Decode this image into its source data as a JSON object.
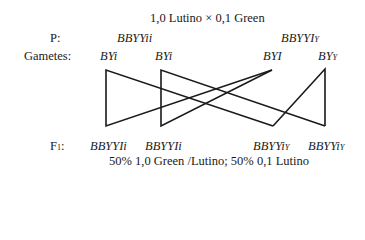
{
  "title": "1,0 Lutino × 0,1 Green",
  "labels": {
    "parents": "P:",
    "gametes": "Gametes:",
    "f1": "F",
    "f1_sub": "1",
    "f1_colon": ":"
  },
  "parents": [
    {
      "genotype": "BBYYii",
      "suffix": ""
    },
    {
      "genotype": "BBYYI",
      "suffix": "Y"
    }
  ],
  "gametes": [
    {
      "genotype": "BYi",
      "suffix": ""
    },
    {
      "genotype": "BYi",
      "suffix": ""
    },
    {
      "genotype": "BYI",
      "suffix": ""
    },
    {
      "genotype": "BY",
      "suffix": "Y"
    }
  ],
  "offspring": [
    {
      "genotype": "BBYYIi",
      "suffix": ""
    },
    {
      "genotype": "BBYYIi",
      "suffix": ""
    },
    {
      "genotype": "BBYYi",
      "suffix": "Y"
    },
    {
      "genotype": "BBYYi",
      "suffix": "Y"
    }
  ],
  "result": "50% 1,0 Green /Lutino; 50% 0,1 Lutino",
  "line_color": "#1a1a1a"
}
